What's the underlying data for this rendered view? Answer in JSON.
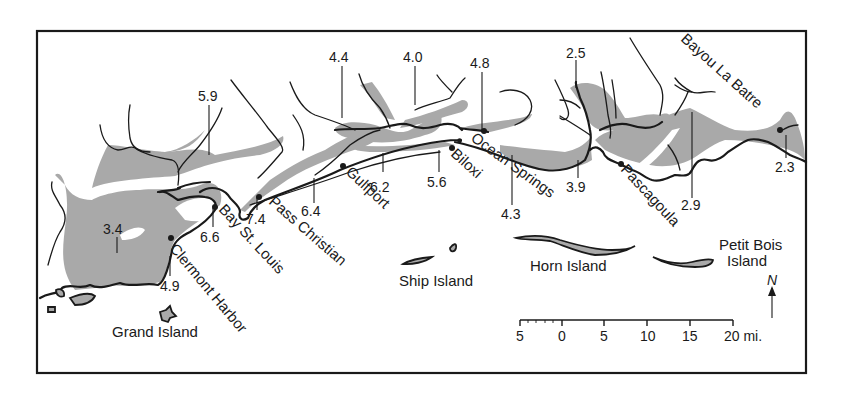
{
  "map": {
    "colors": {
      "marsh": "#a9a9a9",
      "ink": "#1a1a1a",
      "background": "#ffffff"
    },
    "places": {
      "grand_island": "Grand Island",
      "clermont_harbor": "Clermont Harbor",
      "bay_st_louis": "Bay St. Louis",
      "pass_christian": "Pass Christian",
      "gulfport": "Gulfport",
      "biloxi": "Biloxi",
      "ocean_springs": "Ocean Springs",
      "pascagoula": "Pascagoula",
      "bayou_la_batre": "Bayou La Batre",
      "ship_island": "Ship Island",
      "horn_island": "Horn Island",
      "petit_bois_line1": "Petit Bois",
      "petit_bois_line2": "Island"
    },
    "values": [
      {
        "id": "v59",
        "value": "5.9"
      },
      {
        "id": "v44",
        "value": "4.4"
      },
      {
        "id": "v40",
        "value": "4.0"
      },
      {
        "id": "v48",
        "value": "4.8"
      },
      {
        "id": "v25",
        "value": "2.5"
      },
      {
        "id": "v34",
        "value": "3.4"
      },
      {
        "id": "v66",
        "value": "6.6"
      },
      {
        "id": "v74",
        "value": "7.4"
      },
      {
        "id": "v64",
        "value": "6.4"
      },
      {
        "id": "v62",
        "value": "6.2"
      },
      {
        "id": "v56",
        "value": "5.6"
      },
      {
        "id": "v43",
        "value": "4.3"
      },
      {
        "id": "v39",
        "value": "3.9"
      },
      {
        "id": "v29",
        "value": "2.9"
      },
      {
        "id": "v23",
        "value": "2.3"
      },
      {
        "id": "v49",
        "value": "4.9"
      }
    ],
    "scale_bar": {
      "ticks": [
        "5",
        "0",
        "5",
        "10",
        "15",
        "20 mi."
      ]
    },
    "north_arrow": {
      "label": "N"
    }
  }
}
